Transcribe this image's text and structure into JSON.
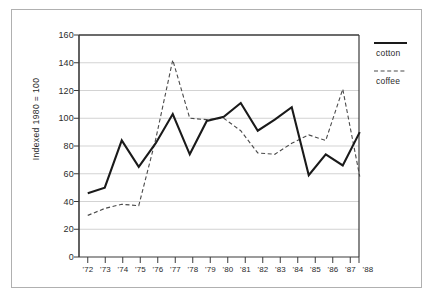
{
  "chart_data": {
    "type": "line",
    "title": "",
    "xlabel": "",
    "ylabel": "Indexed 1980 = 100",
    "ylim": [
      0,
      160
    ],
    "yticks": [
      0,
      20,
      40,
      60,
      80,
      100,
      120,
      140,
      160
    ],
    "grid": true,
    "legend_position": "right",
    "categories": [
      "'72",
      "'73",
      "'74",
      "'75",
      "'76",
      "'77",
      "'78",
      "'79",
      "'80",
      "'81",
      "'82",
      "'83",
      "'84",
      "'85",
      "'86",
      "'87",
      "'88"
    ],
    "series": [
      {
        "name": "cotton",
        "style": "solid",
        "color": "#1a1a1a",
        "values": [
          46,
          50,
          84,
          65,
          82,
          103,
          74,
          98,
          101,
          111,
          91,
          99,
          108,
          59,
          74,
          66,
          90
        ]
      },
      {
        "name": "coffee",
        "style": "dashed",
        "color": "#4a4a4a",
        "values": [
          30,
          35,
          38,
          37,
          85,
          142,
          100,
          99,
          100,
          91,
          75,
          74,
          82,
          88,
          84,
          121,
          58
        ]
      }
    ]
  },
  "legend": {
    "entries": [
      {
        "label": "cotton",
        "style": "solid"
      },
      {
        "label": "coffee",
        "style": "dashed"
      }
    ]
  },
  "colors": {
    "frame_border": "#b0b0b0",
    "axis": "#3a3a3a",
    "gridline": "#c8c8c8",
    "background": "#ffffff",
    "text": "#2b2b2b"
  }
}
